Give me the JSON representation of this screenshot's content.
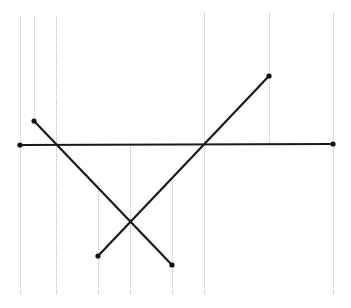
{
  "diagram": {
    "type": "segment-intersection-sweep",
    "colors": {
      "segment": "#1a1a1a",
      "sweep_line": "#b8b8b8",
      "endpoint": "#111111",
      "background": "#ffffff"
    },
    "segments": [
      {
        "id": "horizontal",
        "x1": 20,
        "y1": 145,
        "x2": 333,
        "y2": 144
      },
      {
        "id": "descending",
        "x1": 34,
        "y1": 121,
        "x2": 172,
        "y2": 265
      },
      {
        "id": "ascending",
        "x1": 98,
        "y1": 256,
        "x2": 269,
        "y2": 76
      }
    ],
    "sweep_lines": [
      {
        "x": 20,
        "y1": 17,
        "y2": 294
      },
      {
        "x": 34,
        "y1": 17,
        "y2": 121
      },
      {
        "x": 56,
        "y1": 17,
        "y2": 294
      },
      {
        "x": 98,
        "y1": 183,
        "y2": 294
      },
      {
        "x": 130,
        "y1": 145,
        "y2": 294
      },
      {
        "x": 172,
        "y1": 183,
        "y2": 294
      },
      {
        "x": 204,
        "y1": 13,
        "y2": 294
      },
      {
        "x": 269,
        "y1": 13,
        "y2": 144
      },
      {
        "x": 333,
        "y1": 13,
        "y2": 294
      }
    ],
    "endpoints": [
      {
        "x": 20,
        "y": 145
      },
      {
        "x": 333,
        "y": 144
      },
      {
        "x": 34,
        "y": 121
      },
      {
        "x": 172,
        "y": 265
      },
      {
        "x": 98,
        "y": 256
      },
      {
        "x": 269,
        "y": 76
      }
    ],
    "intersections": [
      {
        "x": 56,
        "y": 145
      },
      {
        "x": 204,
        "y": 144
      },
      {
        "x": 130,
        "y": 221
      }
    ]
  }
}
